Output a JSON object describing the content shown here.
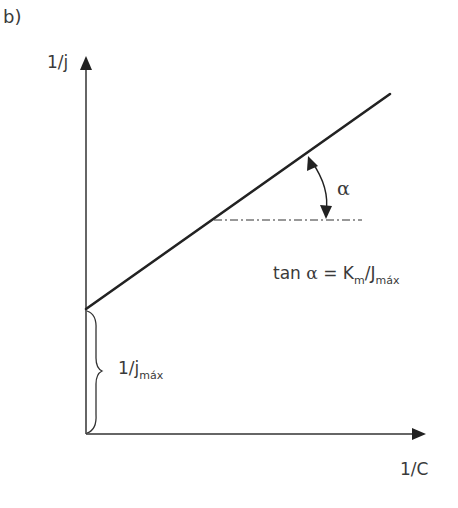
{
  "panel_label": "b)",
  "axes": {
    "y_label": "1/j",
    "x_label": "1/C"
  },
  "angle": {
    "symbol": "α"
  },
  "formula": {
    "prefix": "tan ",
    "alpha": "α",
    "equals": " = K",
    "km_sub": "m",
    "slash": "/J",
    "jmax_sub": "máx"
  },
  "intercept": {
    "main": "1/j",
    "sub": "máx"
  },
  "colors": {
    "line": "#222222",
    "axis": "#333333",
    "text": "#3a3a3a"
  }
}
